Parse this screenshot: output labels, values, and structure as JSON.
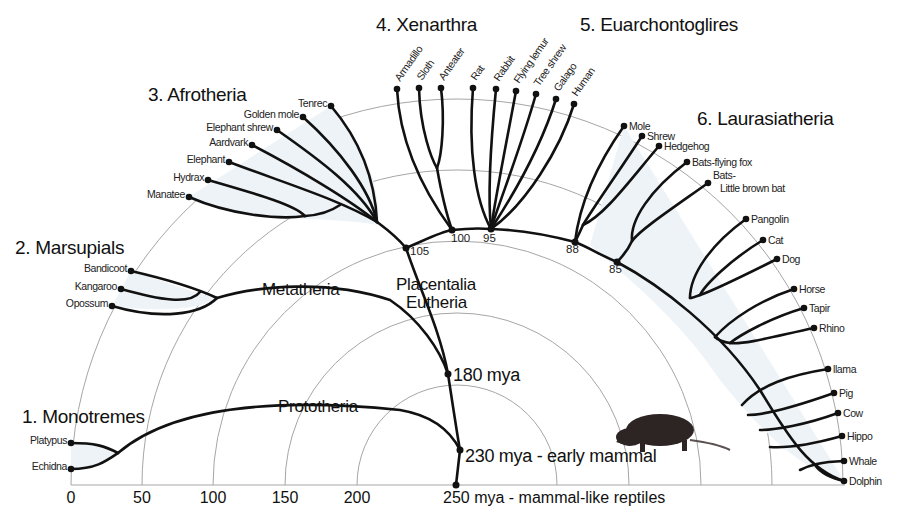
{
  "diagram": {
    "type": "radial-phylogenetic-tree",
    "axis": {
      "ticks": [
        "0",
        "50",
        "100",
        "150",
        "200"
      ],
      "tick_x": [
        71,
        142,
        213,
        285,
        357
      ],
      "center_label": "250 mya - mammal-like reptiles"
    },
    "groups": [
      {
        "id": "monotremes",
        "label": "1. Monotremes",
        "x": 22,
        "y": 423
      },
      {
        "id": "marsupials",
        "label": "2. Marsupials",
        "x": 15,
        "y": 254
      },
      {
        "id": "afrotheria",
        "label": "3. Afrotheria",
        "x": 148,
        "y": 101
      },
      {
        "id": "xenarthra",
        "label": "4. Xenarthra",
        "x": 376,
        "y": 31
      },
      {
        "id": "euarchontoglires",
        "label": "5. Euarchontoglires",
        "x": 580,
        "y": 31
      },
      {
        "id": "laurasiatheria",
        "label": "6. Laurasiatheria",
        "x": 697,
        "y": 125
      }
    ],
    "clades": [
      {
        "label": "Prototheria",
        "x": 278,
        "y": 412
      },
      {
        "label": "Metatheria",
        "x": 262,
        "y": 295
      },
      {
        "label": "Placentalia",
        "x": 396,
        "y": 290
      },
      {
        "label": "Eutheria",
        "x": 406,
        "y": 308
      }
    ],
    "time_annotations": [
      {
        "label": "180 mya",
        "x": 453,
        "y": 381
      },
      {
        "label": "230 mya - early mammal",
        "x": 465,
        "y": 462
      }
    ],
    "node_ages": [
      {
        "label": "105",
        "x": 410,
        "y": 255
      },
      {
        "label": "100",
        "x": 451,
        "y": 242
      },
      {
        "label": "95",
        "x": 483,
        "y": 242
      },
      {
        "label": "88",
        "x": 566,
        "y": 253
      },
      {
        "label": "85",
        "x": 609,
        "y": 273
      }
    ],
    "tips": {
      "monotremes": [
        {
          "name": "Platypus",
          "x": 71,
          "y": 443
        },
        {
          "name": "Echidna",
          "x": 71,
          "y": 469
        }
      ],
      "marsupials": [
        {
          "name": "Bandicoot",
          "x": 131,
          "y": 271
        },
        {
          "name": "Kangaroo",
          "x": 121,
          "y": 289
        },
        {
          "name": "Opossum",
          "x": 112,
          "y": 306
        }
      ],
      "afrotheria": [
        {
          "name": "Manatee",
          "x": 189,
          "y": 197
        },
        {
          "name": "Hydrax",
          "x": 208,
          "y": 180
        },
        {
          "name": "Elephant",
          "x": 229,
          "y": 162
        },
        {
          "name": "Aardvark",
          "x": 252,
          "y": 145
        },
        {
          "name": "Elephant shrew",
          "x": 277,
          "y": 130
        },
        {
          "name": "Golden mole",
          "x": 303,
          "y": 117
        },
        {
          "name": "Tenrec",
          "x": 331,
          "y": 106
        }
      ],
      "xenarthra": [
        {
          "name": "Armadillo",
          "x": 397,
          "y": 89
        },
        {
          "name": "Sloth",
          "x": 419,
          "y": 88
        },
        {
          "name": "Anteater",
          "x": 441,
          "y": 88
        }
      ],
      "euarchontoglires": [
        {
          "name": "Rat",
          "x": 473,
          "y": 88
        },
        {
          "name": "Rabbit",
          "x": 496,
          "y": 89
        },
        {
          "name": "Flying lemur",
          "x": 516,
          "y": 91
        },
        {
          "name": "Tree shrew",
          "x": 536,
          "y": 94
        },
        {
          "name": "Galago",
          "x": 556,
          "y": 99
        },
        {
          "name": "Human",
          "x": 574,
          "y": 104
        }
      ],
      "laurasiatheria": [
        {
          "name": "Mole",
          "x": 624,
          "y": 126
        },
        {
          "name": "Shrew",
          "x": 642,
          "y": 136
        },
        {
          "name": "Hedgehog",
          "x": 659,
          "y": 146
        },
        {
          "name": "Bats-flying fox",
          "x": 687,
          "y": 162
        },
        {
          "name": "Bats-",
          "name2": "Little brown bat",
          "x": 708,
          "y": 183
        },
        {
          "name": "Pangolin",
          "x": 746,
          "y": 219
        },
        {
          "name": "Cat",
          "x": 763,
          "y": 240
        },
        {
          "name": "Dog",
          "x": 777,
          "y": 259
        },
        {
          "name": "Horse",
          "x": 794,
          "y": 289
        },
        {
          "name": "Tapir",
          "x": 804,
          "y": 308
        },
        {
          "name": "Rhino",
          "x": 814,
          "y": 328
        },
        {
          "name": "llama",
          "x": 828,
          "y": 369
        },
        {
          "name": "Pig",
          "x": 834,
          "y": 393
        },
        {
          "name": "Cow",
          "x": 838,
          "y": 413
        },
        {
          "name": "Hippo",
          "x": 842,
          "y": 436
        },
        {
          "name": "Whale",
          "x": 844,
          "y": 461
        },
        {
          "name": "Dolphin",
          "x": 844,
          "y": 481
        }
      ]
    },
    "illustration": "rodent-silhouette"
  }
}
